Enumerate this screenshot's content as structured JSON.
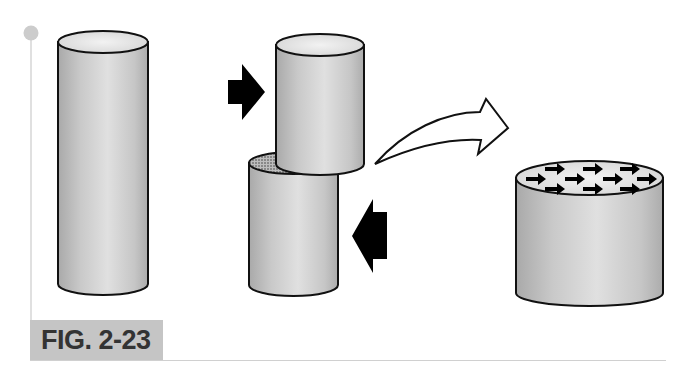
{
  "figure": {
    "label": "FIG. 2-23",
    "colors": {
      "cylinder_body": "#c4c4c4",
      "cylinder_highlight": "#e6e6e6",
      "cylinder_top": "#e4e4e4",
      "outline": "#111111",
      "accent_marker": "#cccccc",
      "label_box": "#c5c5c5",
      "label_text": "#333333",
      "arrow_fill": "#000000"
    },
    "panels": [
      {
        "name": "intact-cylinder",
        "description": "Tall intact cylinder"
      },
      {
        "name": "sheared-cylinder",
        "description": "Cylinder split into two offset pieces by opposing forces",
        "forces": [
          "right-pointing arrow (upper left)",
          "left-pointing arrow (lower right)"
        ],
        "shear_surface": "stippled"
      },
      {
        "name": "transition-arrow",
        "description": "Curved hollow arrow pointing right"
      },
      {
        "name": "shear-plane-view",
        "description": "Short cylinder whose top face shows parallel arrows",
        "arrow_rows": [
          3,
          4,
          3
        ]
      }
    ]
  }
}
